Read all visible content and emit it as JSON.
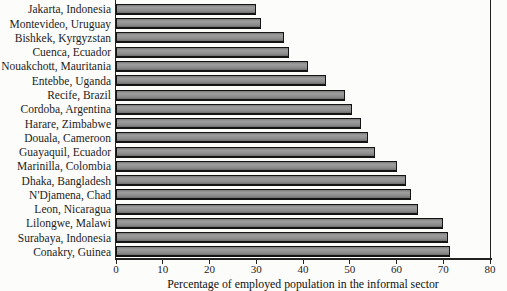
{
  "chart_data": {
    "type": "bar",
    "orientation": "horizontal",
    "title": "",
    "xlabel": "Percentage of employed population in the informal sector",
    "ylabel": "",
    "xlim": [
      0,
      80
    ],
    "x_ticks": [
      0,
      10,
      20,
      30,
      40,
      50,
      60,
      70,
      80
    ],
    "grid": false,
    "legend": "none",
    "categories": [
      "Jakarta, Indonesia",
      "Montevideo, Uruguay",
      "Bishkek, Kyrgyzstan",
      "Cuenca, Ecuador",
      "Nouakchott, Mauritania",
      "Entebbe, Uganda",
      "Recife, Brazil",
      "Cordoba, Argentina",
      "Harare, Zimbabwe",
      "Douala, Cameroon",
      "Guayaquil, Ecuador",
      "Marinilla, Colombia",
      "Dhaka, Bangladesh",
      "N'Djamena, Chad",
      "Leon, Nicaragua",
      "Lilongwe, Malawi",
      "Surabaya, Indonesia",
      "Conakry, Guinea"
    ],
    "values": [
      30,
      31,
      36,
      37,
      41,
      45,
      49,
      50.5,
      52.5,
      54,
      55.5,
      60,
      62,
      63,
      64.5,
      70,
      71,
      71.5
    ],
    "colors": {
      "bar_fill": "#8d8d8d",
      "bar_border": "#141414",
      "axis": "#222222",
      "text": "#1d1d1d",
      "background": "#fcfcfa"
    }
  }
}
